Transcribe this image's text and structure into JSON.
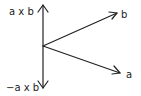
{
  "diagram": {
    "labels": {
      "cross_up": "a x b",
      "cross_down": "−a x b",
      "vector_b": "b",
      "vector_a": "a"
    },
    "colors": {
      "stroke": "#222222",
      "background": "#ffffff"
    }
  }
}
